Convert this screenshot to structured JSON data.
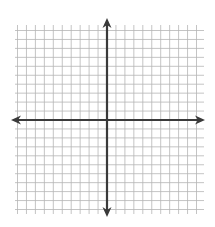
{
  "chart_data": {
    "type": "scatter",
    "title": "",
    "subtitle": "",
    "xlabel": "",
    "ylabel": "",
    "x_range": [
      -10,
      10
    ],
    "y_range": [
      -10,
      10
    ],
    "grid": true,
    "legend": null,
    "series": [],
    "tick_labels": {
      "x": [],
      "y": []
    }
  },
  "style": {
    "grid_color": "#b5b5b5",
    "axis_color": "#3a3a3a",
    "background": "#ffffff"
  },
  "geometry": {
    "grid_left": 15,
    "grid_right": 204,
    "grid_top": 25,
    "grid_bottom": 214,
    "origin_x": 107,
    "origin_y": 120,
    "step": 8.95,
    "units_each_side": 10,
    "x_axis_start": 11,
    "x_axis_end": 205,
    "y_axis_start": 18,
    "y_axis_end": 217
  }
}
